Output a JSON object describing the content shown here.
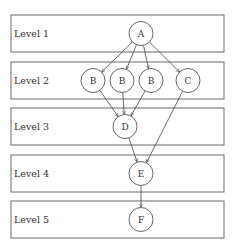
{
  "diagram": {
    "type": "layered-dag",
    "levels": [
      {
        "label": "Level 1",
        "nodes": [
          "A"
        ]
      },
      {
        "label": "Level 2",
        "nodes": [
          "B",
          "B",
          "B",
          "C"
        ]
      },
      {
        "label": "Level 3",
        "nodes": [
          "D"
        ]
      },
      {
        "label": "Level 4",
        "nodes": [
          "E"
        ]
      },
      {
        "label": "Level 5",
        "nodes": [
          "F"
        ]
      }
    ],
    "edges": [
      {
        "from": "A",
        "to": "B#1"
      },
      {
        "from": "A",
        "to": "B#2"
      },
      {
        "from": "A",
        "to": "B#3"
      },
      {
        "from": "A",
        "to": "C"
      },
      {
        "from": "B#1",
        "to": "D"
      },
      {
        "from": "B#2",
        "to": "D"
      },
      {
        "from": "B#3",
        "to": "D"
      },
      {
        "from": "C",
        "to": "E"
      },
      {
        "from": "D",
        "to": "E"
      },
      {
        "from": "E",
        "to": "F"
      }
    ]
  }
}
